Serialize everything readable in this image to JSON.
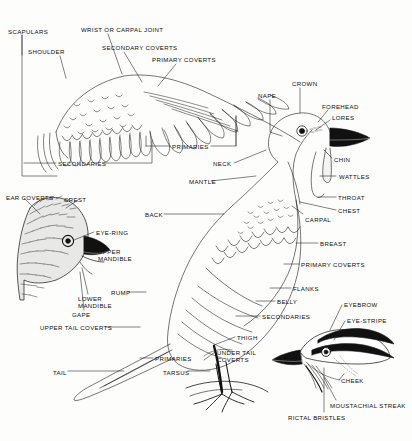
{
  "diagram": {
    "style": {
      "ink": "#111111",
      "paper": "#fdfdfb",
      "line": "#1a1a1a"
    },
    "panels": [
      {
        "id": "wing",
        "name": "spread-wing-detail"
      },
      {
        "id": "body",
        "name": "whole-bird-perched"
      },
      {
        "id": "head-left",
        "name": "crested-head-detail"
      },
      {
        "id": "head-right",
        "name": "striped-head-detail"
      }
    ],
    "labels": [
      {
        "id": "scapulars",
        "text": "SCAPULARS",
        "x": 8,
        "y": 28
      },
      {
        "id": "wrist-carpal-joint",
        "text": "WRIST OR CARPAL JOINT",
        "x": 81,
        "y": 26
      },
      {
        "id": "shoulder",
        "text": "SHOULDER",
        "x": 28,
        "y": 48
      },
      {
        "id": "secondary-coverts",
        "text": "SECONDARY COVERTS",
        "x": 102,
        "y": 44
      },
      {
        "id": "primary-coverts-wing",
        "text": "PRIMARY COVERTS",
        "x": 152,
        "y": 56
      },
      {
        "id": "secondaries-wing",
        "text": "SECONDARIES",
        "x": 58,
        "y": 160
      },
      {
        "id": "primaries-wing",
        "text": "PRIMARIES",
        "x": 172,
        "y": 143
      },
      {
        "id": "nape",
        "text": "NAPE",
        "x": 258,
        "y": 92
      },
      {
        "id": "crown",
        "text": "CROWN",
        "x": 292,
        "y": 80
      },
      {
        "id": "forehead",
        "text": "FOREHEAD",
        "x": 322,
        "y": 103
      },
      {
        "id": "lores",
        "text": "LORES",
        "x": 332,
        "y": 114
      },
      {
        "id": "chin",
        "text": "CHIN",
        "x": 334,
        "y": 156
      },
      {
        "id": "wattles",
        "text": "WATTLES",
        "x": 339,
        "y": 173
      },
      {
        "id": "throat",
        "text": "THROAT",
        "x": 338,
        "y": 194
      },
      {
        "id": "chest",
        "text": "CHEST",
        "x": 338,
        "y": 207
      },
      {
        "id": "neck",
        "text": "NECK",
        "x": 213,
        "y": 160
      },
      {
        "id": "mantle",
        "text": "MANTLE",
        "x": 189,
        "y": 178
      },
      {
        "id": "back",
        "text": "BACK",
        "x": 145,
        "y": 211
      },
      {
        "id": "carpal",
        "text": "CARPAL",
        "x": 305,
        "y": 216
      },
      {
        "id": "breast",
        "text": "BREAST",
        "x": 320,
        "y": 240
      },
      {
        "id": "primary-coverts-body",
        "text": "PRIMARY COVERTS",
        "x": 301,
        "y": 261
      },
      {
        "id": "flanks",
        "text": "FLANKS",
        "x": 293,
        "y": 285
      },
      {
        "id": "belly",
        "text": "BELLY",
        "x": 277,
        "y": 298
      },
      {
        "id": "secondaries-body",
        "text": "SECONDARIES",
        "x": 262,
        "y": 313
      },
      {
        "id": "ear-coverts",
        "text": "EAR COVERTS",
        "x": 6,
        "y": 194
      },
      {
        "id": "crest",
        "text": "CREST",
        "x": 64,
        "y": 196
      },
      {
        "id": "eye-ring",
        "text": "EYE-RING",
        "x": 96,
        "y": 229
      },
      {
        "id": "upper-mandible",
        "text": "UPPER\nMANDIBLE",
        "x": 98,
        "y": 248
      },
      {
        "id": "lower-mandible",
        "text": "LOWER\nMANDIBLE",
        "x": 78,
        "y": 295
      },
      {
        "id": "gape",
        "text": "GAPE",
        "x": 72,
        "y": 311
      },
      {
        "id": "rump",
        "text": "RUMP",
        "x": 111,
        "y": 289
      },
      {
        "id": "upper-tail-coverts",
        "text": "UPPER TAIL COVERTS",
        "x": 40,
        "y": 324
      },
      {
        "id": "tail",
        "text": "TAIL",
        "x": 53,
        "y": 369
      },
      {
        "id": "primaries-body",
        "text": "PRIMARIES",
        "x": 155,
        "y": 355
      },
      {
        "id": "tarsus",
        "text": "TARSUS",
        "x": 163,
        "y": 369
      },
      {
        "id": "thigh",
        "text": "THIGH",
        "x": 237,
        "y": 334
      },
      {
        "id": "under-tail-coverts",
        "text": "UNDER TAIL\nCOVERTS",
        "x": 217,
        "y": 349
      },
      {
        "id": "eyebrow",
        "text": "EYEBROW",
        "x": 344,
        "y": 301
      },
      {
        "id": "eye-stripe",
        "text": "EYE-STRIPE",
        "x": 347,
        "y": 317
      },
      {
        "id": "cheek",
        "text": "CHEEK",
        "x": 341,
        "y": 377
      },
      {
        "id": "moustachial-streak",
        "text": "MOUSTACHIAL STREAK",
        "x": 330,
        "y": 402
      },
      {
        "id": "rictal-bristles",
        "text": "RICTAL BRISTLES",
        "x": 288,
        "y": 414
      }
    ]
  }
}
